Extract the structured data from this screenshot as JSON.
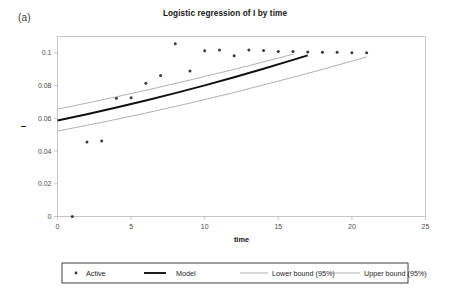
{
  "figure": {
    "panel_label": "(a)",
    "title": "Logistic regression of I by time"
  },
  "chart_data": {
    "type": "scatter",
    "title": "Logistic regression of I by time",
    "xlabel": "time",
    "ylabel": "I",
    "xlim": [
      0,
      25
    ],
    "ylim": [
      0,
      0.11
    ],
    "xticks": [
      0,
      5,
      10,
      15,
      20,
      25
    ],
    "xtick_labels": [
      "0",
      "5",
      "10",
      "15",
      "20",
      "25"
    ],
    "yticks": [
      0,
      0.02,
      0.04,
      0.06,
      0.08,
      0.1
    ],
    "ytick_labels": [
      "0",
      "0.02",
      "0.04",
      "0.06",
      "0.08",
      "0.1"
    ],
    "grid": false,
    "legend_position": "bottom",
    "series": [
      {
        "name": "Active",
        "type": "scatter",
        "marker": "dot",
        "color": "#3a3a3a",
        "x": [
          1,
          2,
          3,
          4,
          5,
          6,
          7,
          8,
          9,
          10,
          11,
          12,
          13,
          14,
          15,
          16,
          17,
          18,
          19,
          20,
          21
        ],
        "y": [
          0.0,
          0.0455,
          0.0462,
          0.0722,
          0.0725,
          0.0815,
          0.0862,
          0.1055,
          0.0889,
          0.1013,
          0.1017,
          0.0982,
          0.1017,
          0.1015,
          0.1008,
          0.1008,
          0.1005,
          0.1003,
          0.1003,
          0.1,
          0.1
        ]
      },
      {
        "name": "Model",
        "type": "line",
        "color": "#111111",
        "x": [
          0,
          2,
          4,
          6,
          8,
          10,
          12,
          14,
          16,
          17
        ],
        "y": [
          0.0587,
          0.0625,
          0.0666,
          0.0709,
          0.0754,
          0.0801,
          0.0851,
          0.0903,
          0.0957,
          0.0985
        ]
      },
      {
        "name": "Lower bound (95%)",
        "type": "line",
        "color": "#9d9d9d",
        "x": [
          0,
          3,
          6,
          9,
          12,
          15,
          18,
          21
        ],
        "y": [
          0.0522,
          0.0575,
          0.0632,
          0.0693,
          0.0758,
          0.0827,
          0.0899,
          0.0975
        ]
      },
      {
        "name": "Upper bound (95%)",
        "type": "line",
        "color": "#9d9d9d",
        "x": [
          0,
          3,
          6,
          9,
          12,
          15,
          16
        ],
        "y": [
          0.0656,
          0.0712,
          0.0771,
          0.0834,
          0.0899,
          0.0968,
          0.0992
        ]
      }
    ],
    "legend_entries": [
      {
        "label": "Active",
        "marker": "dot",
        "color": "#3a3a3a"
      },
      {
        "label": "Model",
        "marker": "line-thick",
        "color": "#111111"
      },
      {
        "label": "Lower bound (95%)",
        "marker": "line-thin",
        "color": "#9d9d9d"
      },
      {
        "label": "Upper bound (95%)",
        "marker": "line-thin",
        "color": "#9d9d9d"
      }
    ]
  }
}
